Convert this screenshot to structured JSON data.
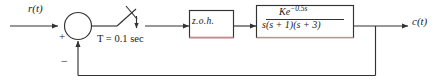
{
  "diagram": {
    "type": "block-diagram",
    "background_color": "#ffffff",
    "line_color": "#333333",
    "accent_color": "#cc8a8f",
    "signals": {
      "input_label": "r(t)",
      "output_label": "c(t)"
    },
    "summing_junction": {
      "name": "summing-junction",
      "plus_sign": "+",
      "minus_sign": "−"
    },
    "sampler": {
      "name": "sampler-switch",
      "label": "T = 0.1 sec",
      "period_symbol": "T",
      "period_value": "0.1",
      "period_units": "sec"
    },
    "blocks": [
      {
        "name": "zero-order-hold",
        "label": "z.o.h.",
        "border_color": "#333333",
        "bottom_border_color": "#cc8a8f"
      },
      {
        "name": "plant-transfer-function",
        "numerator": "Ke",
        "numerator_exponent": "−0.5s",
        "denominator": "s(s + 1)(s + 3)",
        "border_color": "#333333",
        "bottom_border_color": "#cc8a8f"
      }
    ],
    "feedback_path": {
      "name": "unity-feedback-path",
      "gain": "1"
    }
  }
}
